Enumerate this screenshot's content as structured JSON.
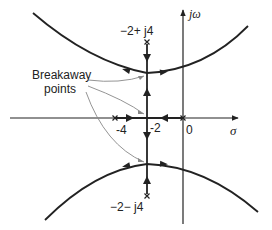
{
  "diagram": {
    "type": "root-locus",
    "axes": {
      "real_axis_label": "σ",
      "imag_axis_label": "jω"
    },
    "poles": [
      {
        "label": "-2+j4",
        "re": -2,
        "im": 4
      },
      {
        "label": "-2-j4",
        "re": -2,
        "im": -4
      },
      {
        "label": "",
        "re": -4,
        "im": 0
      },
      {
        "label": "",
        "re": 0,
        "im": 0
      }
    ],
    "tick_labels": {
      "minus4": "-4",
      "minus2": "-2",
      "zero": "0"
    },
    "annotation": {
      "line1": "Breakaway",
      "line2": "points"
    },
    "pole_upper_label": "−2+ j4",
    "pole_lower_label": "−2− j4",
    "pole_marker": "x",
    "colors": {
      "stroke": "#222222",
      "pointer": "#888888"
    }
  }
}
